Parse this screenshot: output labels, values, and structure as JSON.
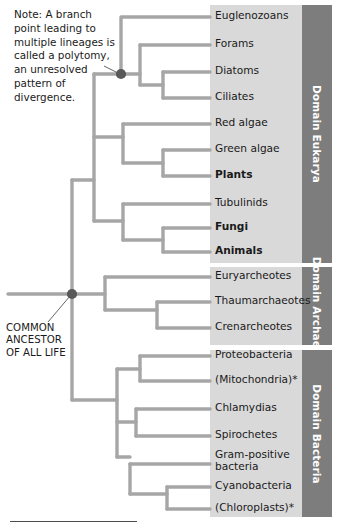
{
  "figure": {
    "width": 340,
    "height": 529
  },
  "annotations": {
    "polytomy_note": "Note: A branch point leading to multiple lineages is called a polytomy, an unresolved pattern of divergence.",
    "common_ancestor": "COMMON\nANCESTOR\nOF ALL LIFE"
  },
  "colors": {
    "branch": "#a6a6a6",
    "node_dot": "#595959",
    "panel_light": "#d9d9d9",
    "panel_dark": "#7d7d7d",
    "band_text": "#ffffff",
    "text": "#1a1a1a",
    "rule": "#4d4d4d"
  },
  "domains": [
    {
      "name": "Domain Eukarya",
      "band_label": "Domain Eukarya",
      "taxa": [
        {
          "label": "Euglenozoans",
          "bold": false
        },
        {
          "label": "Forams",
          "bold": false
        },
        {
          "label": "Diatoms",
          "bold": false
        },
        {
          "label": "Ciliates",
          "bold": false
        },
        {
          "label": "Red algae",
          "bold": false
        },
        {
          "label": "Green algae",
          "bold": false
        },
        {
          "label": "Plants",
          "bold": true
        },
        {
          "label": "Tubulinids",
          "bold": false
        },
        {
          "label": "Fungi",
          "bold": true
        },
        {
          "label": "Animals",
          "bold": true
        }
      ]
    },
    {
      "name": "Domain Archaea",
      "band_label": "Domain\nArchaea",
      "taxa": [
        {
          "label": "Euryarcheotes",
          "bold": false
        },
        {
          "label": "Thaumarchaeotes",
          "bold": false
        },
        {
          "label": "Crenarcheotes",
          "bold": false
        }
      ]
    },
    {
      "name": "Domain Bacteria",
      "band_label": "Domain Bacteria",
      "taxa": [
        {
          "label": "Proteobacteria",
          "bold": false
        },
        {
          "label": "(Mitochondria)*",
          "bold": false
        },
        {
          "label": "Chlamydias",
          "bold": false
        },
        {
          "label": "Spirochetes",
          "bold": false
        },
        {
          "label": "Gram-positive\nbacteria",
          "bold": false
        },
        {
          "label": "Cyanobacteria",
          "bold": false
        },
        {
          "label": "(Chloroplasts)*",
          "bold": false
        }
      ]
    }
  ],
  "leaf_rows": [
    {
      "label": "Euglenozoans",
      "y": 17,
      "bold": false,
      "domain": 0
    },
    {
      "label": "Forams",
      "y": 45,
      "bold": false,
      "domain": 0
    },
    {
      "label": "Diatoms",
      "y": 72,
      "bold": false,
      "domain": 0
    },
    {
      "label": "Ciliates",
      "y": 98,
      "bold": false,
      "domain": 0
    },
    {
      "label": "Red algae",
      "y": 124,
      "bold": false,
      "domain": 0
    },
    {
      "label": "Green algae",
      "y": 150,
      "bold": false,
      "domain": 0
    },
    {
      "label": "Plants",
      "y": 176,
      "bold": true,
      "domain": 0
    },
    {
      "label": "Tubulinids",
      "y": 204,
      "bold": false,
      "domain": 0
    },
    {
      "label": "Fungi",
      "y": 228,
      "bold": true,
      "domain": 0
    },
    {
      "label": "Animals",
      "y": 252,
      "bold": true,
      "domain": 0
    },
    {
      "label": "Euryarcheotes",
      "y": 277,
      "bold": false,
      "domain": 1
    },
    {
      "label": "Thaumarchaeotes",
      "y": 302,
      "bold": false,
      "domain": 1
    },
    {
      "label": "Crenarcheotes",
      "y": 328,
      "bold": false,
      "domain": 1
    },
    {
      "label": "Proteobacteria",
      "y": 356,
      "bold": false,
      "domain": 2
    },
    {
      "label": "(Mitochondria)*",
      "y": 381,
      "bold": false,
      "domain": 2
    },
    {
      "label": "Chlamydias",
      "y": 409,
      "bold": false,
      "domain": 2
    },
    {
      "label": "Spirochetes",
      "y": 436,
      "bold": false,
      "domain": 2
    },
    {
      "label": "Gram-positive\nbacteria",
      "y": 462,
      "bold": false,
      "domain": 2
    },
    {
      "label": "Cyanobacteria",
      "y": 487,
      "bold": false,
      "domain": 2
    },
    {
      "label": "(Chloroplasts)*",
      "y": 509,
      "bold": false,
      "domain": 2
    }
  ],
  "footnote_marker": "*"
}
